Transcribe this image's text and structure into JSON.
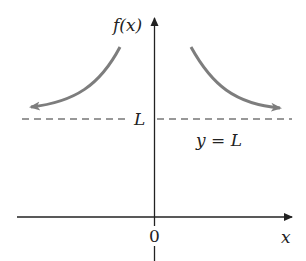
{
  "diagram": {
    "y_axis_label": "f(x)",
    "x_axis_label": "x",
    "origin_label": "0",
    "asymptote_label": "L",
    "asymptote_equation": "y = L",
    "colors": {
      "axes": "#222222",
      "curve": "#7d7d7d",
      "asymptote": "#333333"
    }
  }
}
